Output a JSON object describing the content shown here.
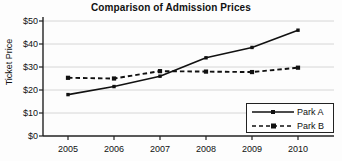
{
  "chart_data": {
    "type": "line",
    "title": "Comparison of Admission Prices",
    "xlabel": "",
    "ylabel": "Ticket Price",
    "categories": [
      "2005",
      "2006",
      "2007",
      "2008",
      "2009",
      "2010"
    ],
    "x": [
      2005,
      2006,
      2007,
      2008,
      2009,
      2010
    ],
    "series": [
      {
        "name": "Park A",
        "values": [
          18,
          21.5,
          26,
          34,
          38.5,
          46
        ],
        "line_style": "solid",
        "marker": "square",
        "color": "#111111"
      },
      {
        "name": "Park B",
        "values": [
          25.3,
          25,
          28.2,
          28,
          27.8,
          29.7
        ],
        "line_style": "dashed",
        "marker": "square",
        "color": "#111111"
      }
    ],
    "ylim": [
      0,
      50
    ],
    "ytick_labels": [
      "$0",
      "$10",
      "$20",
      "$30",
      "$40",
      "$50"
    ],
    "ytick_values": [
      0,
      10,
      20,
      30,
      40,
      50
    ],
    "xtick_labels": [
      "2005",
      "2006",
      "2007",
      "2008",
      "2009",
      "2010"
    ],
    "grid": true,
    "grid_axis": "y",
    "legend_position": "bottom-right",
    "legend_entries": [
      "Park A",
      "Park B"
    ],
    "background_color": "#fdfdfd",
    "axis_color": "#222222",
    "grid_color": "#cccccc"
  }
}
